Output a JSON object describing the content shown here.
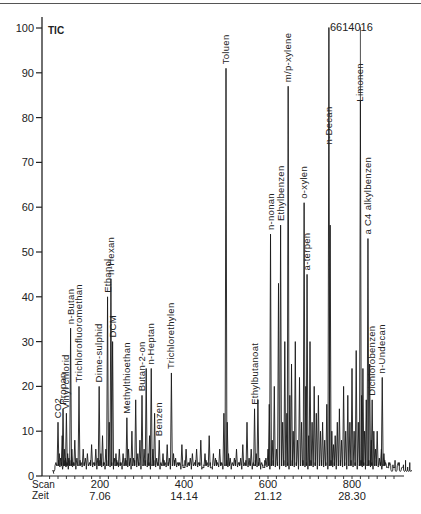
{
  "chart_data": {
    "type": "line",
    "title": "TIC",
    "subtitle": "",
    "xlabel": "Scan / Zeit",
    "ylabel": "",
    "ylim": [
      0,
      100
    ],
    "xlim": [
      0,
      940
    ],
    "grid": false,
    "legend": "none",
    "y_ticks": [
      "0",
      "10",
      "20",
      "30",
      "40",
      "50",
      "60",
      "70",
      "80",
      "90",
      "100"
    ],
    "x_axis": {
      "row1_label": "Scan",
      "row2_label": "Zeit",
      "ticks": [
        {
          "scan": "200",
          "zeit": "7.06"
        },
        {
          "scan": "400",
          "zeit": "14.14"
        },
        {
          "scan": "600",
          "zeit": "21.12"
        },
        {
          "scan": "800",
          "zeit": "28.30"
        }
      ]
    },
    "top_annotation": "6614016",
    "peaks": [
      {
        "label": "CO2",
        "scan": 100,
        "height": 12
      },
      {
        "label": "Propan",
        "scan": 112,
        "height": 15
      },
      {
        "label": "Vinyl chlorid",
        "scan": 120,
        "height": 14
      },
      {
        "label": "n-Butan",
        "scan": 130,
        "height": 33
      },
      {
        "label": "Trichlorofluoromethan",
        "scan": 150,
        "height": 20
      },
      {
        "label": "Dime-sulphid",
        "scan": 198,
        "height": 20
      },
      {
        "label": "Ethanol",
        "scan": 218,
        "height": 40
      },
      {
        "label": "n-Hexan",
        "scan": 226,
        "height": 44
      },
      {
        "label": "DCM",
        "scan": 230,
        "height": 30
      },
      {
        "label": "Methylthioethan",
        "scan": 264,
        "height": 13
      },
      {
        "label": "Butan-2-on",
        "scan": 300,
        "height": 18
      },
      {
        "label": "n-Heptan",
        "scan": 322,
        "height": 24
      },
      {
        "label": "Benzen",
        "scan": 341,
        "height": 8
      },
      {
        "label": "Trichlorethylen",
        "scan": 370,
        "height": 23
      },
      {
        "label": "Toluen",
        "scan": 500,
        "height": 91
      },
      {
        "label": "Ethylbutanoat",
        "scan": 568,
        "height": 15
      },
      {
        "label": "n-nonan",
        "scan": 606,
        "height": 54
      },
      {
        "label": "Ethylbenzen",
        "scan": 630,
        "height": 56
      },
      {
        "label": "m/p-xylene",
        "scan": 648,
        "height": 87
      },
      {
        "label": "o-xylen",
        "scan": 686,
        "height": 61
      },
      {
        "label": "a-terpen",
        "scan": 693,
        "height": 45
      },
      {
        "label": "n-Decan",
        "scan": 745,
        "height": 100
      },
      {
        "label": "Limonen",
        "scan": 820,
        "height": 84
      },
      {
        "label": "a C4 alkylbenzen",
        "scan": 838,
        "height": 53
      },
      {
        "label": "Dichlorobenzen",
        "scan": 848,
        "height": 17
      },
      {
        "label": "n-Undecan",
        "scan": 872,
        "height": 22
      }
    ],
    "series": [
      {
        "name": "TIC",
        "x": [
          90,
          95,
          100,
          103,
          106,
          110,
          112,
          115,
          118,
          120,
          123,
          126,
          130,
          133,
          136,
          140,
          145,
          150,
          155,
          160,
          165,
          170,
          175,
          180,
          185,
          190,
          195,
          198,
          202,
          206,
          210,
          214,
          218,
          222,
          226,
          230,
          234,
          238,
          242,
          246,
          250,
          255,
          260,
          264,
          268,
          272,
          276,
          280,
          285,
          290,
          295,
          300,
          305,
          310,
          315,
          318,
          322,
          326,
          330,
          335,
          341,
          345,
          350,
          355,
          360,
          365,
          370,
          375,
          380,
          385,
          390,
          395,
          400,
          405,
          410,
          415,
          420,
          425,
          430,
          435,
          440,
          445,
          450,
          455,
          460,
          465,
          470,
          475,
          480,
          485,
          490,
          495,
          500,
          503,
          506,
          510,
          515,
          520,
          525,
          530,
          535,
          540,
          545,
          550,
          555,
          560,
          565,
          568,
          572,
          576,
          580,
          585,
          590,
          595,
          600,
          603,
          606,
          610,
          615,
          620,
          625,
          630,
          635,
          640,
          645,
          648,
          652,
          656,
          660,
          665,
          670,
          675,
          680,
          686,
          690,
          693,
          697,
          700,
          705,
          710,
          715,
          720,
          725,
          730,
          735,
          740,
          745,
          748,
          752,
          756,
          760,
          765,
          770,
          775,
          780,
          785,
          790,
          795,
          800,
          805,
          810,
          815,
          820,
          823,
          826,
          830,
          834,
          838,
          842,
          846,
          848,
          852,
          856,
          860,
          865,
          870,
          872,
          876,
          880,
          885,
          890,
          895,
          900,
          905,
          910,
          915,
          920,
          925,
          930,
          935,
          940
        ],
        "y": [
          1,
          3,
          12,
          5,
          4,
          9,
          15,
          6,
          4,
          14,
          5,
          4,
          33,
          6,
          3,
          8,
          4,
          20,
          3,
          6,
          4,
          5,
          3,
          7,
          3,
          6,
          4,
          20,
          5,
          9,
          3,
          6,
          40,
          12,
          44,
          30,
          4,
          5,
          3,
          6,
          3,
          5,
          4,
          13,
          6,
          4,
          10,
          4,
          17,
          5,
          8,
          18,
          6,
          24,
          5,
          9,
          24,
          6,
          14,
          4,
          8,
          3,
          5,
          3,
          7,
          4,
          23,
          5,
          4,
          3,
          3,
          7,
          2,
          6,
          3,
          4,
          5,
          3,
          6,
          3,
          8,
          2,
          5,
          3,
          9,
          2,
          5,
          4,
          3,
          6,
          3,
          14,
          91,
          12,
          5,
          4,
          3,
          4,
          6,
          3,
          4,
          7,
          3,
          12,
          4,
          6,
          3,
          15,
          5,
          17,
          4,
          3,
          2,
          4,
          6,
          16,
          54,
          8,
          20,
          6,
          43,
          56,
          12,
          30,
          14,
          87,
          18,
          25,
          10,
          30,
          8,
          22,
          12,
          61,
          20,
          45,
          9,
          30,
          12,
          20,
          14,
          18,
          10,
          12,
          8,
          16,
          100,
          56,
          10,
          7,
          9,
          12,
          15,
          8,
          20,
          10,
          18,
          12,
          24,
          10,
          28,
          12,
          84,
          18,
          24,
          10,
          17,
          53,
          25,
          8,
          17,
          10,
          6,
          10,
          4,
          6,
          22,
          5,
          3,
          2,
          3,
          1,
          2,
          1,
          3,
          1,
          2,
          1,
          1,
          1,
          1
        ]
      }
    ]
  },
  "page": {
    "tic_label": "TIC",
    "top_annotation": "6614016",
    "x_row1_label": "Scan",
    "x_row2_label": "Zeit"
  }
}
